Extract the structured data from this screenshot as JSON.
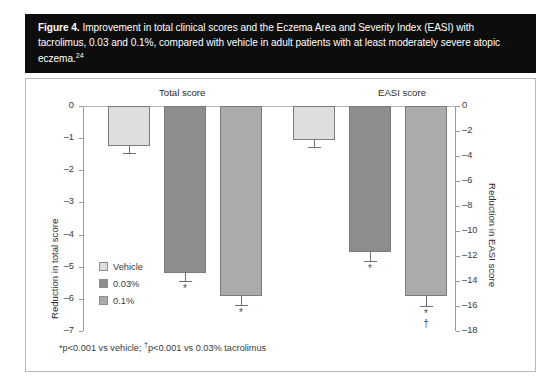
{
  "caption": {
    "figure_label": "Figure 4.",
    "text": " Improvement in total clinical scores and the Eczema Area and Severity Index (EASI) with tacrolimus, 0.03 and 0.1%, compared with vehicle in adult patients with at least moderately severe atopic eczema.",
    "reference": "24"
  },
  "footnote": {
    "part1": "*p<0.001 vs vehicle; ",
    "dagger": "†",
    "part2": "p<0.001 vs 0.03% tacrolimus"
  },
  "legend": {
    "items": [
      {
        "label": "Vehicle",
        "color": "#dedede"
      },
      {
        "label": "0.03%",
        "color": "#8d8d8d"
      },
      {
        "label": "0.1%",
        "color": "#ababab"
      }
    ]
  },
  "colors": {
    "banner_bg": "#0d0d0d",
    "banner_text": "#ffffff",
    "frame_border": "#b9b9b9",
    "axis": "#9a9a9a",
    "bar_outline": "#7b7b7b",
    "vehicle": "#dedede",
    "dose_003": "#8d8d8d",
    "dose_01": "#ababab"
  },
  "chart_data": {
    "type": "bar",
    "title": "Improvement in total clinical scores and the Eczema Area and Severity Index (EASI) with tacrolimus, 0.03 and 0.1%, compared with vehicle in adult patients with at least moderately severe atopic eczema.",
    "xlabel": "",
    "groups": [
      {
        "name": "Total score",
        "axis": "left",
        "ylabel": "Reduction in total score",
        "ylim": [
          -7,
          0
        ],
        "yticks": [
          0,
          -1,
          -2,
          -3,
          -4,
          -5,
          -6,
          -7
        ],
        "ytick_labels": [
          "0",
          "–1",
          "–2",
          "–3",
          "–4",
          "–5",
          "–6",
          "–7"
        ],
        "categories": [
          "Vehicle",
          "0.03%",
          "0.1%"
        ],
        "values": [
          -1.25,
          -5.2,
          -5.9
        ],
        "errors": [
          0.2,
          0.25,
          0.3
        ],
        "significance": [
          "",
          "*",
          "*"
        ]
      },
      {
        "name": "EASI score",
        "axis": "right",
        "ylabel": "Reduction in EASI score",
        "ylim": [
          -18,
          0
        ],
        "yticks": [
          0,
          -2,
          -4,
          -6,
          -8,
          -10,
          -12,
          -14,
          -16,
          -18
        ],
        "ytick_labels": [
          "0",
          "–2",
          "–4",
          "–6",
          "–8",
          "–10",
          "–12",
          "–14",
          "–16",
          "–18"
        ],
        "categories": [
          "Vehicle",
          "0.03%",
          "0.1%"
        ],
        "values": [
          -2.7,
          -11.7,
          -15.2
        ],
        "errors": [
          0.6,
          0.7,
          0.8
        ],
        "significance": [
          "",
          "*",
          "*†"
        ]
      }
    ],
    "series": [
      {
        "name": "Vehicle",
        "color": "#dedede",
        "values": [
          -1.25,
          -2.7
        ]
      },
      {
        "name": "0.03%",
        "color": "#8d8d8d",
        "values": [
          -5.2,
          -11.7
        ]
      },
      {
        "name": "0.1%",
        "color": "#ababab",
        "values": [
          -5.9,
          -15.2
        ]
      }
    ],
    "grid": false,
    "legend_position": "inside-left",
    "annotations": [
      "*p<0.001 vs vehicle",
      "†p<0.001 vs 0.03% tacrolimus"
    ]
  }
}
